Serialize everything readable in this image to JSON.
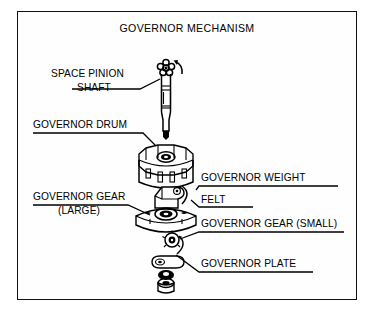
{
  "figure": {
    "title": "GOVERNOR MECHANISM",
    "kind": "exploded-assembly-diagram",
    "border_color": "#111111",
    "ink_color": "#000000",
    "background_color": "#ffffff"
  },
  "labels": {
    "space_pinion_shaft_line1": "SPACE PINION",
    "space_pinion_shaft_line2": "SHAFT",
    "governor_drum": "GOVERNOR DRUM",
    "governor_gear_large_line1": "GOVERNOR GEAR",
    "governor_gear_large_line2": "(LARGE)",
    "governor_weight": "GOVERNOR WEIGHT",
    "felt": "FELT",
    "governor_gear_small": "GOVERNOR GEAR (SMALL)",
    "governor_plate": "GOVERNOR PLATE"
  },
  "parts": [
    {
      "name": "space-pinion-shaft",
      "label": "SPACE PINION SHAFT"
    },
    {
      "name": "governor-drum",
      "label": "GOVERNOR DRUM"
    },
    {
      "name": "governor-weight",
      "label": "GOVERNOR WEIGHT"
    },
    {
      "name": "felt",
      "label": "FELT"
    },
    {
      "name": "governor-gear-large",
      "label": "GOVERNOR GEAR (LARGE)"
    },
    {
      "name": "governor-gear-small",
      "label": "GOVERNOR GEAR (SMALL)"
    },
    {
      "name": "governor-plate",
      "label": "GOVERNOR PLATE"
    }
  ]
}
